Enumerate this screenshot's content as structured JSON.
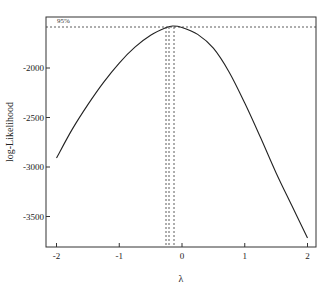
{
  "chart_data": {
    "type": "line",
    "title": "",
    "xlabel": "λ",
    "ylabel": "log-Likelihood",
    "xlim": [
      -2.15,
      2.15
    ],
    "ylim": [
      -3780,
      -1480
    ],
    "xticks": [
      -2,
      -1,
      0,
      1,
      2
    ],
    "xtick_labels": [
      "-2",
      "-1",
      "0",
      "1",
      "2"
    ],
    "yticks": [
      -2000,
      -2500,
      -3000,
      -3500
    ],
    "ytick_labels": [
      "-2000",
      "-2500",
      "-3000",
      "-3500"
    ],
    "grid": false,
    "legend": null,
    "series": [
      {
        "name": "profile log-likelihood",
        "x": [
          -2.0,
          -1.75,
          -1.5,
          -1.25,
          -1.0,
          -0.75,
          -0.5,
          -0.25,
          -0.15,
          0.0,
          0.25,
          0.5,
          0.75,
          1.0,
          1.25,
          1.5,
          1.75,
          2.0
        ],
        "values": [
          -2909,
          -2620,
          -2370,
          -2145,
          -1950,
          -1790,
          -1670,
          -1592,
          -1576,
          -1590,
          -1660,
          -1800,
          -2040,
          -2354,
          -2700,
          -3060,
          -3390,
          -3717
        ]
      }
    ],
    "annotations": {
      "ci_label": "95%",
      "ci_level_y": -1590,
      "mle_lambda": -0.15,
      "ci_vertical_lines_lambda": [
        -0.25,
        -0.21,
        -0.12
      ]
    }
  }
}
